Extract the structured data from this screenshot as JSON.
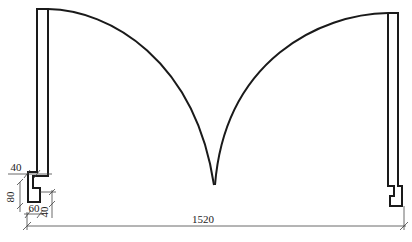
{
  "drawing": {
    "type": "engineering-elevation",
    "subject": "twin leaf arched gate with side posts",
    "line_color": "#1a1a1a",
    "dim_color": "#444444",
    "background": "#ffffff"
  },
  "dimensions": {
    "overall_width": "1520",
    "post_width": "40",
    "foot_height": "80",
    "foot_width": "60",
    "foot_step": "40"
  }
}
